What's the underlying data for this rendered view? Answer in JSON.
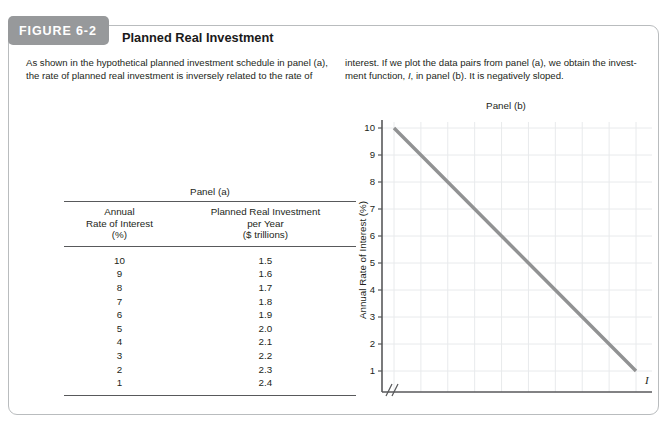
{
  "figure": {
    "badge": "FIGURE 6-2",
    "title": "Planned Real Investment",
    "caption_left": "As shown in the hypothetical planned investment schedule in panel (a), the rate of planned real investment is inversely related to the rate of",
    "caption_right_part1": "interest. If we plot the data pairs from panel (a), we obtain the invest-ment function, ",
    "caption_right_italic": "I",
    "caption_right_part2": ", in panel (b). It is negatively sloped."
  },
  "panel_a": {
    "title": "Panel (a)",
    "columns": [
      {
        "line1": "Annual",
        "line2": "Rate of Interest",
        "line3": "(%)"
      },
      {
        "line1": "Planned Real Investment",
        "line2": "per Year",
        "line3": "($ trillions)"
      }
    ],
    "rows": [
      [
        "10",
        "1.5"
      ],
      [
        "9",
        "1.6"
      ],
      [
        "8",
        "1.7"
      ],
      [
        "7",
        "1.8"
      ],
      [
        "6",
        "1.9"
      ],
      [
        "5",
        "2.0"
      ],
      [
        "4",
        "2.1"
      ],
      [
        "3",
        "2.2"
      ],
      [
        "2",
        "2.3"
      ],
      [
        "1",
        "2.4"
      ]
    ]
  },
  "panel_b": {
    "title": "Panel (b)",
    "curve_label": "I"
  },
  "chart_data": {
    "type": "line",
    "title": "Panel (b)",
    "xlabel": "Planned Real Investment per Year ($ trillions)",
    "ylabel": "Annual Rate of Interest (%)",
    "xlim": [
      1.5,
      2.4
    ],
    "ylim": [
      0,
      10
    ],
    "grid": true,
    "legend": "none",
    "x_origin_label": "0",
    "axis_break": true,
    "xticks": [
      "1.5",
      "1.6",
      "1.7",
      "1.8",
      "1.9",
      "2.0",
      "2.1",
      "2.2",
      "2.3",
      "2.4"
    ],
    "yticks": [
      "1",
      "2",
      "3",
      "4",
      "5",
      "6",
      "7",
      "8",
      "9",
      "10"
    ],
    "series": [
      {
        "name": "I",
        "color": "#919293",
        "x": [
          1.5,
          1.6,
          1.7,
          1.8,
          1.9,
          2.0,
          2.1,
          2.2,
          2.3,
          2.4
        ],
        "y": [
          10,
          9,
          8,
          7,
          6,
          5,
          4,
          3,
          2,
          1
        ]
      }
    ]
  }
}
